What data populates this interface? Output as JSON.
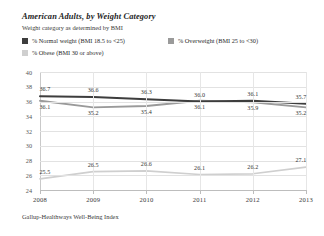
{
  "header": {
    "title": "American Adults, by Weight Category",
    "subtitle": "Weight category as determined by BMI"
  },
  "legend": {
    "items": [
      {
        "label": "% Normal weight (BMI 18.5 to <25)",
        "color": "#3d3d3d",
        "swatch_name": "legend-swatch-normal-weight"
      },
      {
        "label": "% Overweight (BMI 25 to <30)",
        "color": "#9a9a9a",
        "swatch_name": "legend-swatch-overweight"
      },
      {
        "label": "% Obese (BMI 30 or above)",
        "color": "#cfcfcf",
        "swatch_name": "legend-swatch-obese"
      }
    ]
  },
  "footer": {
    "source": "Gallup-Healthways Well-Being Index"
  },
  "chart_data": {
    "type": "line",
    "title": "American Adults, by Weight Category",
    "subtitle": "Weight category as determined by BMI",
    "xlabel": "",
    "ylabel": "",
    "categories": [
      "2008",
      "2009",
      "2010",
      "2011",
      "2012",
      "2013"
    ],
    "ylim": [
      24,
      40
    ],
    "yticks": [
      24,
      26,
      28,
      30,
      32,
      34,
      36,
      38,
      40
    ],
    "grid": true,
    "legend_position": "top",
    "series": [
      {
        "name": "% Normal weight (BMI 18.5 to <25)",
        "color": "#3d3d3d",
        "label_position": "above",
        "values": [
          36.7,
          36.6,
          36.3,
          36.0,
          36.1,
          35.7
        ],
        "labels": [
          "36.7",
          "36.6",
          "36.3",
          "36.0",
          "36.1",
          "35.7"
        ]
      },
      {
        "name": "% Overweight (BMI 25 to <30)",
        "color": "#9a9a9a",
        "label_position": "below",
        "values": [
          36.1,
          35.2,
          35.4,
          36.1,
          35.9,
          35.2
        ],
        "labels": [
          "36.1",
          "35.2",
          "35.4",
          "36.1",
          "35.9",
          "35.2"
        ]
      },
      {
        "name": "% Obese (BMI 30 or above)",
        "color": "#cfcfcf",
        "label_position": "above",
        "values": [
          25.5,
          26.5,
          26.6,
          26.1,
          26.2,
          27.1
        ],
        "labels": [
          "25.5",
          "26.5",
          "26.6",
          "26.1",
          "26.2",
          "27.1"
        ]
      }
    ]
  }
}
